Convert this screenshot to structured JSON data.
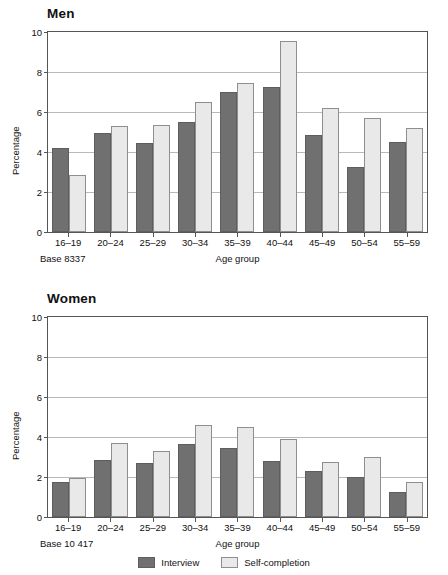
{
  "colors": {
    "interview": "#707070",
    "self_completion": "#e9e9e9",
    "gridline": "#b9b9b9",
    "axis": "#555555"
  },
  "legend": {
    "interview_label": "Interview",
    "self_completion_label": "Self-completion"
  },
  "panels": {
    "men": {
      "title": "Men",
      "base_label": "Base 8337"
    },
    "women": {
      "title": "Women",
      "base_label": "Base 10 417"
    }
  },
  "chart_data": [
    {
      "type": "bar",
      "title": "Men",
      "xlabel": "Age group",
      "ylabel": "Percentage",
      "ylim": [
        0,
        10
      ],
      "yticks": [
        0,
        2,
        4,
        6,
        8,
        10
      ],
      "grid": true,
      "legend_position": "bottom-center-shared",
      "categories": [
        "16–19",
        "20–24",
        "25–29",
        "30–34",
        "35–39",
        "40–44",
        "45–49",
        "50–54",
        "55–59"
      ],
      "series": [
        {
          "name": "Interview",
          "values": [
            4.2,
            4.95,
            4.45,
            5.5,
            7.0,
            7.25,
            4.85,
            3.25,
            4.5
          ]
        },
        {
          "name": "Self-completion",
          "values": [
            2.85,
            5.3,
            5.35,
            6.5,
            7.45,
            9.55,
            6.2,
            5.7,
            5.2
          ]
        }
      ],
      "annotations": [
        "Base 8337"
      ]
    },
    {
      "type": "bar",
      "title": "Women",
      "xlabel": "Age group",
      "ylabel": "Percentage",
      "ylim": [
        0,
        10
      ],
      "yticks": [
        0,
        2,
        4,
        6,
        8,
        10
      ],
      "grid": true,
      "legend_position": "bottom-center-shared",
      "categories": [
        "16–19",
        "20–24",
        "25–29",
        "30–34",
        "35–39",
        "40–44",
        "45–49",
        "50–54",
        "55–59"
      ],
      "series": [
        {
          "name": "Interview",
          "values": [
            1.75,
            2.85,
            2.7,
            3.65,
            3.45,
            2.8,
            2.3,
            2.0,
            1.25
          ]
        },
        {
          "name": "Self-completion",
          "values": [
            1.95,
            3.7,
            3.3,
            4.6,
            4.5,
            3.9,
            2.75,
            3.0,
            1.75
          ]
        }
      ],
      "annotations": [
        "Base 10 417"
      ]
    }
  ]
}
